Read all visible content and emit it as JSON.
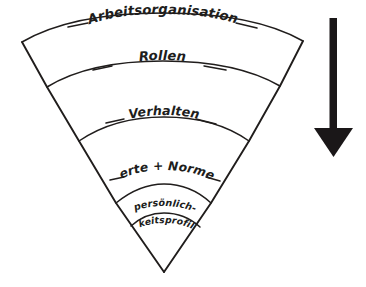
{
  "diagram": {
    "style": "hand-drawn-sketch",
    "ink_color": "#201d1c",
    "background_color": "#ffffff",
    "shape": "inverted-cone-funnel",
    "bands": [
      {
        "id": "band-1",
        "label": "Arbeitsorganisation",
        "level": 1
      },
      {
        "id": "band-2",
        "label": "Rollen",
        "level": 2
      },
      {
        "id": "band-3",
        "label": "Verhalten",
        "level": 3
      },
      {
        "id": "band-4",
        "label": "Werte + Normen",
        "level": 4
      },
      {
        "id": "band-5",
        "label_line1": "persönlich-",
        "label_line2": "keitsprofil",
        "level": 5
      }
    ],
    "arrow": {
      "id": "direction-arrow",
      "orientation": "down",
      "color": "#1a1718"
    }
  }
}
